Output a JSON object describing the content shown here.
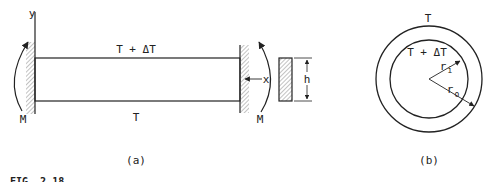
{
  "figure_a": {
    "label": "(a)",
    "top_temperature": "T + ΔT",
    "bottom_temperature": "T",
    "y_axis": "y",
    "x_axis": "x",
    "moment_left": "M",
    "moment_right": "M",
    "height_dim": "h"
  },
  "figure_b": {
    "label": "(b)",
    "outer_temperature": "T",
    "inner_temperature": "T + ΔT",
    "inner_radius": "r",
    "inner_radius_sub": "i",
    "outer_radius": "r",
    "outer_radius_sub": "o"
  },
  "caption": {
    "text": "FIG. 2.18"
  },
  "colors": {
    "line": "#222222",
    "hatch": "#555555",
    "background": "#ffffff"
  }
}
